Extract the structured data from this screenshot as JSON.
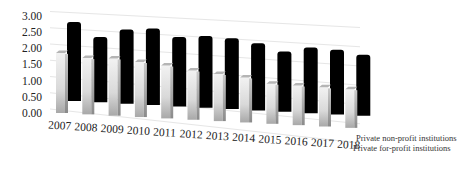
{
  "chart_data": {
    "type": "bar",
    "style": "3d-clustered-column",
    "title": "",
    "xlabel": "",
    "ylabel": "",
    "ylim": [
      0,
      3.0
    ],
    "yticks": [
      "0.00",
      "0.50",
      "1.00",
      "1.50",
      "2.00",
      "2.50",
      "3.00"
    ],
    "grid": true,
    "legend_position": "bottom-right",
    "categories": [
      "2007",
      "2008",
      "2009",
      "2010",
      "2011",
      "2012",
      "2013",
      "2014",
      "2015",
      "2016",
      "2017",
      "2018"
    ],
    "series": [
      {
        "name": "Private non-profit institutions",
        "color": "#000000",
        "values": [
          2.4,
          2.0,
          2.3,
          2.4,
          2.2,
          2.3,
          2.3,
          2.2,
          2.0,
          2.2,
          2.2,
          2.1
        ]
      },
      {
        "name": "Private for-profit institutions",
        "color": "#d8d8d8",
        "values": [
          1.85,
          1.75,
          1.8,
          1.75,
          1.7,
          1.6,
          1.55,
          1.5,
          1.35,
          1.35,
          1.35,
          1.35
        ]
      }
    ]
  }
}
